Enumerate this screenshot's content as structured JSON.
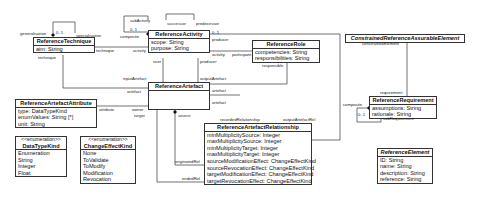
{
  "classes": {
    "technique": {
      "name": "ReferenceTechnique",
      "attrs": [
        "aim: String"
      ]
    },
    "activity": {
      "name": "ReferenceActivity",
      "attrs": [
        "scope: String",
        "purpose: String"
      ]
    },
    "role": {
      "name": "ReferenceRole",
      "attrs": [
        "competencies: String",
        "responsibilities: String"
      ]
    },
    "artefact": {
      "name": "ReferenceArtefact",
      "attrs": []
    },
    "attribute": {
      "name": "ReferenceArtefactAttribute",
      "attrs": [
        "type: DataTypeKind",
        "enumValues: String [*]",
        "unit: String"
      ]
    },
    "relationship": {
      "name": "ReferenceArtefactRelationship",
      "attrs": [
        "minMultiplicitySource: Integer",
        "maxMultiplicitySource: Integer",
        "minMultiplicityTarget: Integer",
        "maxMultiplicityTarget: Integer",
        "sourceModificationEffect: ChangeEffectKind",
        "sourceRevocationEffect: ChangeEffectKind",
        "targetModificationEffect: ChangeEffectKind",
        "targetRevocationEffect: ChangeEffectKind"
      ]
    },
    "datatype": {
      "stereotype": "<<enumeration>>",
      "name": "DataTypeKind",
      "attrs": [
        "Enumeration",
        "String",
        "Integer",
        "Float"
      ]
    },
    "changeeffect": {
      "stereotype": "<<enumeration>>",
      "name": "ChangeEffectKind",
      "attrs": [
        "None",
        "ToValidate",
        "ToModify",
        "Modification",
        "Revocation"
      ]
    },
    "constrained": {
      "name": "ConstrainedReferenceAssurableElement",
      "attrs": []
    },
    "requirement": {
      "name": "ReferenceRequirement",
      "attrs": [
        "assumptions: String",
        "rationale: String"
      ]
    },
    "element": {
      "name": "ReferenceElement",
      "attrs": [
        "ID: String",
        "name: String",
        "description: String",
        "reference: String"
      ]
    }
  },
  "labels": {
    "generalisation": "generalisation",
    "gen_mult": "0..1",
    "specialisation": "specialisation",
    "technique_end": "technique",
    "technique_star": "*",
    "technique_left": "technique",
    "activity_end": "activity",
    "activity_star": "*",
    "subActivity": "subActivity",
    "sub_mult": "0..1",
    "composite": "composite",
    "successor": "successor",
    "predecessor": "predecessor",
    "star": "*",
    "act_mult": "0..1",
    "producer": "producer",
    "participant": "participant",
    "activity2": "activity",
    "responsible": "responsible",
    "user": "user",
    "producer2": "producer",
    "inputArtefact": "inputArtefact",
    "outputArtefact": "outputArtefact",
    "artefact": "artefact",
    "artefact2": "artefact",
    "artefact3": "artefact",
    "attribute": "attribute",
    "owner": "owner",
    "one": "1",
    "target": "target",
    "source": "source",
    "recordedRelationship": "recordedRelationship",
    "outputArtefactRel": "outputArtefactRel",
    "originatedRel": "originatedRel",
    "endedRel": "endedRel",
    "constrainedElement": "constrainedElement",
    "requirement": "requirement",
    "composite2": "composite",
    "subRequirement": "subRequirement",
    "req_mult": "0..1"
  }
}
